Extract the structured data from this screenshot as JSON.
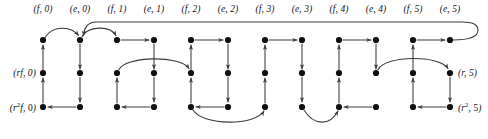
{
  "figure": {
    "kind": "directed-graph",
    "colors": {
      "node": "#111111",
      "edge": "#3a3a3a",
      "label": "#141414",
      "background": "#ffffff"
    },
    "grid": {
      "columns": 12,
      "rows": 3,
      "column_x": [
        43,
        80,
        117,
        154,
        191,
        228,
        265,
        302,
        339,
        376,
        413,
        450
      ],
      "row_y": [
        40,
        73,
        107
      ],
      "node_radius": 3.1
    },
    "column_labels": [
      {
        "group": "f",
        "index": "0",
        "text": "(f, 0)"
      },
      {
        "group": "e",
        "index": "0",
        "text": "(e, 0)"
      },
      {
        "group": "f",
        "index": "1",
        "text": "(f, 1)"
      },
      {
        "group": "e",
        "index": "1",
        "text": "(e, 1)"
      },
      {
        "group": "f",
        "index": "2",
        "text": "(f, 2)"
      },
      {
        "group": "e",
        "index": "2",
        "text": "(e, 2)"
      },
      {
        "group": "f",
        "index": "3",
        "text": "(f, 3)"
      },
      {
        "group": "e",
        "index": "3",
        "text": "(e, 3)"
      },
      {
        "group": "f",
        "index": "4",
        "text": "(f, 4)"
      },
      {
        "group": "e",
        "index": "4",
        "text": "(e, 4)"
      },
      {
        "group": "f",
        "index": "5",
        "text": "(f, 5)"
      },
      {
        "group": "e",
        "index": "5",
        "text": "(e, 5)"
      }
    ],
    "side_labels": {
      "left_middle": "(rf, 0)",
      "left_bottom": "(r2f, 0)",
      "right_middle": "(r, 5)",
      "right_bottom": "(r2, 5)"
    },
    "label_parts": {
      "left_middle": {
        "base": "rf",
        "exp": "",
        "num": "0"
      },
      "left_bottom": {
        "base": "r",
        "exp": "2",
        "tail": "f",
        "num": "0"
      },
      "right_middle": {
        "base": "r",
        "exp": "",
        "num": "5"
      },
      "right_bottom": {
        "base": "r",
        "exp": "2",
        "num": "5"
      }
    }
  }
}
